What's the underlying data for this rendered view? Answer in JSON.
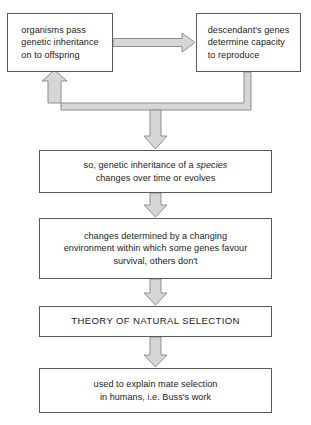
{
  "diagram": {
    "type": "flowchart",
    "title_text": "",
    "colors": {
      "box_border": "#5a5a5a",
      "box_fill": "#ffffff",
      "arrow_fill": "#d6d6d6",
      "arrow_stroke": "#8e8e8e",
      "text": "#1b1b1b",
      "background": "#ffffff"
    },
    "nodes": [
      {
        "id": "organisms",
        "text": "organisms pass\ngenetic inheritance\non to offspring",
        "align": "left"
      },
      {
        "id": "descendant",
        "text": "descendant's genes\ndetermine capacity\nto reproduce",
        "align": "left"
      },
      {
        "id": "species",
        "line1_a": "so, genetic inheritance of a ",
        "line1_em": "species",
        "line2": "changes over time or evolves",
        "text": "so, genetic inheritance of a species\nchanges over time or evolves",
        "align": "center"
      },
      {
        "id": "changes",
        "text": "changes determined by a changing\nenvironment within which some genes favour\nsurvival, others don't",
        "align": "center"
      },
      {
        "id": "theory",
        "text": "THEORY OF NATURAL SELECTION",
        "align": "center"
      },
      {
        "id": "buss",
        "text": "used to explain mate selection\nin humans, i.e. Buss's work",
        "align": "center"
      }
    ],
    "connectors": [
      {
        "id": "organisms-to-descendant",
        "kind": "block-arrow-right"
      },
      {
        "id": "descendant-feedback-to-organisms",
        "kind": "block-arrow-loop-up"
      },
      {
        "id": "loop-to-species",
        "kind": "block-arrow-down"
      },
      {
        "id": "species-to-changes",
        "kind": "block-arrow-down"
      },
      {
        "id": "changes-to-theory",
        "kind": "block-arrow-down"
      },
      {
        "id": "theory-to-buss",
        "kind": "block-arrow-down"
      }
    ]
  }
}
